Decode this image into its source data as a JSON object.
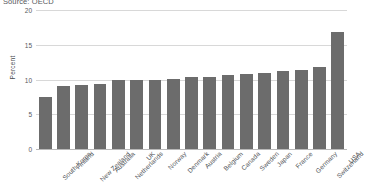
{
  "source_note": "Source: OECD",
  "chart_data": {
    "type": "bar",
    "title": "",
    "subtitle": "",
    "xlabel": "",
    "ylabel": "Percent",
    "ylim": [
      0,
      20
    ],
    "yticks": [
      0,
      5,
      10,
      15,
      20
    ],
    "ytick_labels": [
      "0",
      "5",
      "10",
      "15",
      "20"
    ],
    "grid": true,
    "legend": false,
    "legend_position": "none",
    "bar_color": "#6c6c6c",
    "gridline_color": "#d8d8d8",
    "background_color": "#ffffff",
    "annotations": [
      "Source: OECD"
    ],
    "categories": [
      "South Korea",
      "Finland",
      "New Zealand",
      "Australia",
      "Netherlands",
      "UK",
      "Norway",
      "Denmark",
      "Austria",
      "Belgium",
      "Canada",
      "Sweden",
      "Japan",
      "France",
      "Germany",
      "Switzerland",
      "USA"
    ],
    "values": [
      7.5,
      9.0,
      9.2,
      9.3,
      9.9,
      10.0,
      10.0,
      10.1,
      10.3,
      10.3,
      10.7,
      10.8,
      10.9,
      11.2,
      11.4,
      11.8,
      16.8
    ]
  }
}
